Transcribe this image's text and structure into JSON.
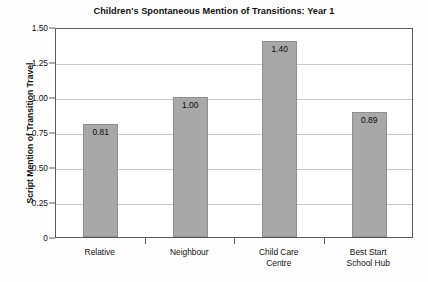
{
  "chart_data": {
    "type": "bar",
    "title": "Children's Spontaneous Mention of Transitions: Year 1",
    "xlabel": "",
    "ylabel": "Script Mention of Transition Travel",
    "categories": [
      "Relative",
      "Neighbour",
      "Child Care Centre",
      "Best Start School Hub"
    ],
    "category_lines": [
      [
        "Relative"
      ],
      [
        "Neighbour"
      ],
      [
        "Child Care",
        "Centre"
      ],
      [
        "Best Start",
        "School Hub"
      ]
    ],
    "values": [
      0.81,
      1.0,
      1.4,
      0.89
    ],
    "value_labels": [
      "0.81",
      "1.00",
      "1.40",
      "0.89"
    ],
    "ylim": [
      0,
      1.5
    ],
    "yticks": [
      0,
      0.25,
      0.5,
      0.75,
      1.0,
      1.25,
      1.5
    ],
    "ytick_labels": [
      "0",
      "0.25",
      "0.50",
      "0.75",
      "1.00",
      "1.25",
      "1.50"
    ],
    "grid": true,
    "legend": null,
    "bar_color": "#a8a8a8",
    "bar_edge_color": "#8f8f8f",
    "grid_color": "#c9c9c9",
    "axis_color": "#5c5c5c",
    "background_color": "#fefefe"
  }
}
